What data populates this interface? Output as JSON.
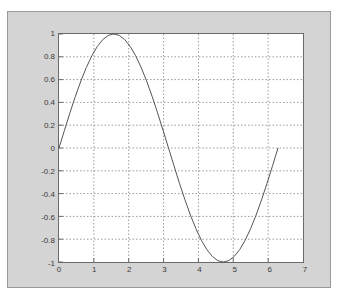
{
  "figure": {
    "panel_color": "#d4d4d4",
    "panel_border_color": "#9a9a9a",
    "plot_bg_color": "#ffffff",
    "axis_color": "#6a6a6a",
    "grid_color": "#9a9a9a",
    "curve_color": "#555555",
    "tick_label_color": "#3a3a3a"
  },
  "chart_data": {
    "type": "line",
    "title": "",
    "xlabel": "",
    "ylabel": "",
    "xlim": [
      0,
      7
    ],
    "ylim": [
      -1,
      1
    ],
    "grid": true,
    "grid_style": "dotted",
    "legend": null,
    "xticks": [
      "0",
      "1",
      "2",
      "3",
      "4",
      "5",
      "6",
      "7"
    ],
    "xtick_values": [
      0,
      1,
      2,
      3,
      4,
      5,
      6,
      7
    ],
    "yticks": [
      "1",
      "0.8",
      "0.6",
      "0.4",
      "0.2",
      "0",
      "-0.2",
      "-0.4",
      "-0.6",
      "-0.8",
      "-1"
    ],
    "ytick_values": [
      1,
      0.8,
      0.6,
      0.4,
      0.2,
      0,
      -0.2,
      -0.4,
      -0.6,
      -0.8,
      -1
    ],
    "series": [
      {
        "name": "sin(x)",
        "x": [
          0,
          0.157,
          0.314,
          0.471,
          0.628,
          0.785,
          0.942,
          1.1,
          1.257,
          1.414,
          1.571,
          1.728,
          1.885,
          2.042,
          2.199,
          2.356,
          2.513,
          2.67,
          2.827,
          2.985,
          3.142,
          3.299,
          3.456,
          3.613,
          3.77,
          3.927,
          4.084,
          4.241,
          4.398,
          4.555,
          4.712,
          4.869,
          5.027,
          5.184,
          5.341,
          5.498,
          5.655,
          5.812,
          5.969,
          6.126,
          6.283
        ],
        "y": [
          0,
          0.156,
          0.309,
          0.454,
          0.588,
          0.707,
          0.809,
          0.891,
          0.951,
          0.988,
          1,
          0.988,
          0.951,
          0.891,
          0.809,
          0.707,
          0.588,
          0.454,
          0.309,
          0.156,
          0,
          -0.156,
          -0.309,
          -0.454,
          -0.588,
          -0.707,
          -0.809,
          -0.891,
          -0.951,
          -0.988,
          -1,
          -0.988,
          -0.951,
          -0.891,
          -0.809,
          -0.707,
          -0.588,
          -0.454,
          -0.309,
          -0.156,
          0
        ]
      }
    ]
  }
}
